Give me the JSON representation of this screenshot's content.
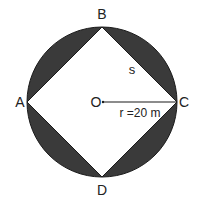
{
  "diagram": {
    "type": "circle-inscribed-square",
    "vertices": {
      "A": "A",
      "B": "B",
      "C": "C",
      "D": "D"
    },
    "center_label": "O",
    "radius_label": "r =20 m",
    "side_label": "s",
    "colors": {
      "shaded": "#3a3a3a",
      "stroke": "#1a1a1a",
      "background": "#ffffff"
    }
  }
}
